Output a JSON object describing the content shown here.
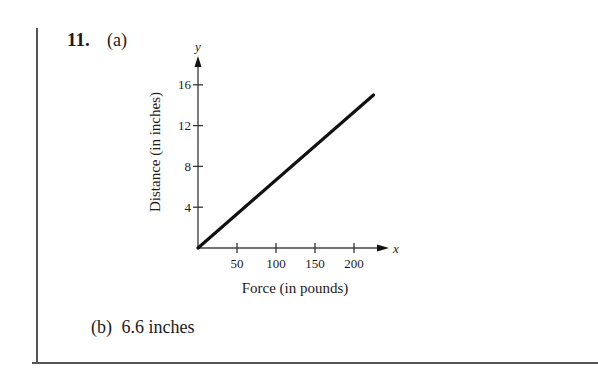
{
  "problem": {
    "number": "11.",
    "part_a_label": "(a)",
    "part_b_label": "(b)",
    "part_b_answer": "6.6 inches"
  },
  "chart_data": {
    "type": "line",
    "title": "",
    "xlabel": "Force (in pounds)",
    "ylabel": "Distance (in inches)",
    "x_axis_var": "x",
    "y_axis_var": "y",
    "x_ticks": [
      50,
      100,
      150,
      200
    ],
    "y_ticks": [
      4,
      8,
      12,
      16
    ],
    "xlim": [
      0,
      240
    ],
    "ylim": [
      0,
      18
    ],
    "grid": false,
    "legend": null,
    "series": [
      {
        "name": "Distance vs Force",
        "x": [
          0,
          225
        ],
        "y": [
          0,
          15
        ],
        "color": "#111111"
      }
    ]
  }
}
